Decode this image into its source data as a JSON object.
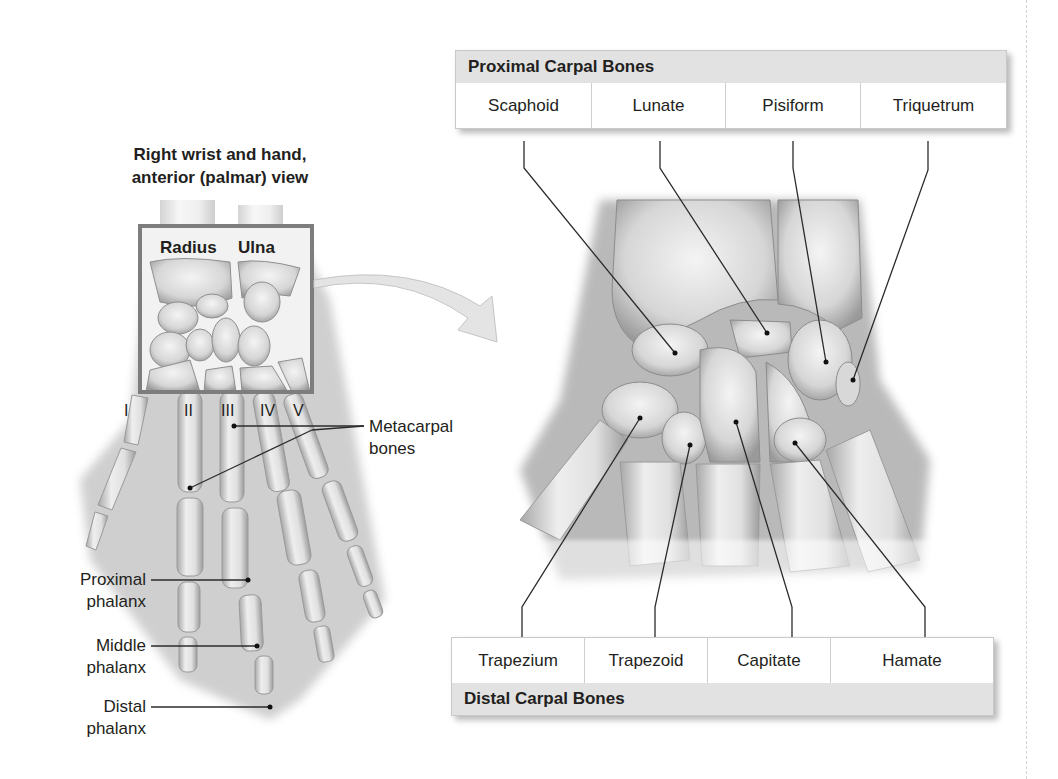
{
  "figure": {
    "left_title": "Right wrist and hand, anterior (palmar) view",
    "left_title_line1": "Right wrist and hand,",
    "left_title_line2": "anterior (palmar) view",
    "inset_labels": {
      "radius": "Radius",
      "ulna": "Ulna"
    },
    "metacarpal_numerals": [
      "I",
      "II",
      "III",
      "IV",
      "V"
    ],
    "left_labels": {
      "metacarpal_line1": "Metacarpal",
      "metacarpal_line2": "bones",
      "proximal_line1": "Proximal",
      "proximal_line2": "phalanx",
      "middle_line1": "Middle",
      "middle_line2": "phalanx",
      "distal_line1": "Distal",
      "distal_line2": "phalanx"
    },
    "proximal_table": {
      "header": "Proximal Carpal Bones",
      "cells": [
        "Scaphoid",
        "Lunate",
        "Pisiform",
        "Triquetrum"
      ]
    },
    "distal_table": {
      "header": "Distal Carpal Bones",
      "cells": [
        "Trapezium",
        "Trapezoid",
        "Capitate",
        "Hamate"
      ]
    },
    "colors": {
      "header_band": "#e2e2e2",
      "bone_light": "#ececec",
      "bone_shadow": "#8a8a8a",
      "leader_line": "#2b2b2b",
      "arrow_fill": "#e4e4e4"
    }
  }
}
